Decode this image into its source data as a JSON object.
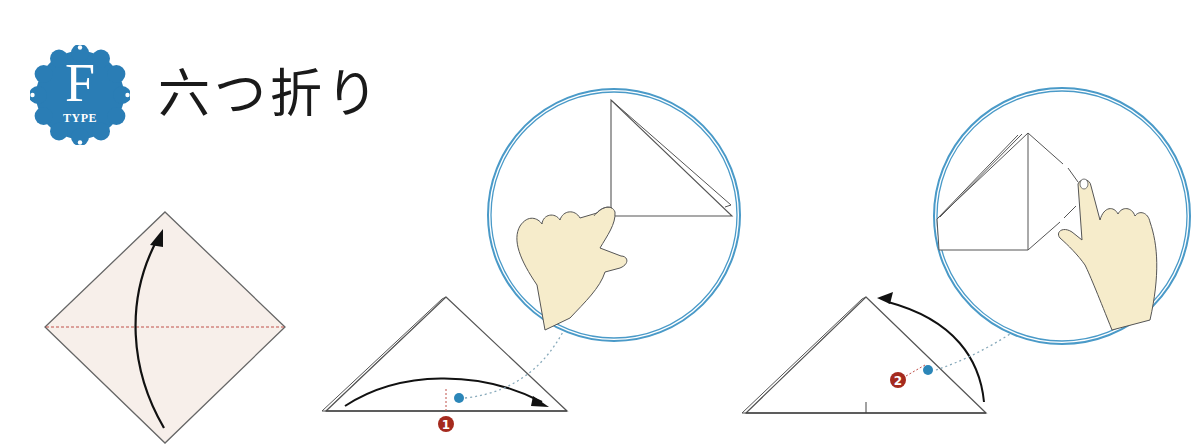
{
  "header": {
    "badge_letter": "F",
    "badge_subtitle": "TYPE",
    "title": "六つ折り"
  },
  "colors": {
    "badge_blue": "#2a7db5",
    "circle_blue": "#4a9ac8",
    "paper_tint": "#f7efea",
    "crease_red": "#c0504a",
    "step_red": "#a52a1e",
    "pointer_blue": "#2b86b8",
    "hand_skin": "#f6eccb",
    "line": "#555555"
  },
  "steps": [
    {
      "number": "1",
      "description": "fold-base-right-over"
    },
    {
      "number": "2",
      "description": "fold-up-to-apex"
    }
  ],
  "icons": {
    "fold_arrow": "curved-arrow",
    "hand": "pointing-hand",
    "zoom_circle": "magnify-detail-circle"
  }
}
